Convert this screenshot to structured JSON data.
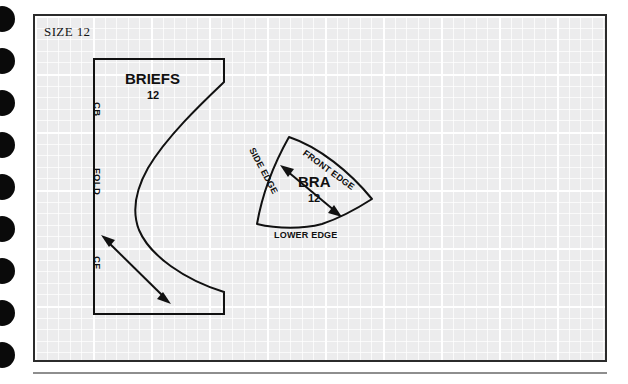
{
  "page": {
    "size_label": "SIZE 12",
    "background_color": "#ffffff",
    "sheet_color": "#ececed",
    "ink_color": "#111111",
    "frame_color": "#2b2b2b"
  },
  "binder_holes": {
    "count": 9,
    "color": "#0a0a0a"
  },
  "pieces": {
    "briefs": {
      "title": "BRIEFS",
      "size": "12",
      "edges": {
        "center_back": "CB",
        "fold": "FOLD",
        "center_front": "CF"
      },
      "grainline": "double-headed-arrow"
    },
    "bra": {
      "title": "BRA",
      "size": "12",
      "edges": {
        "side": "SIDE EDGE",
        "front": "FRONT EDGE",
        "lower": "LOWER EDGE"
      },
      "grainline": "double-headed-arrow"
    }
  }
}
